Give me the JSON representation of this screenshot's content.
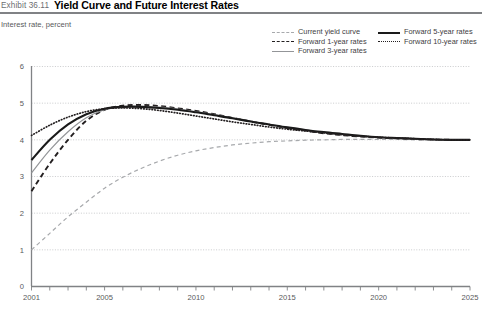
{
  "header": {
    "exhibit_number": "Exhibit 36.11",
    "title": "Yield Curve and Future Interest Rates"
  },
  "axis_caption": "Interest rate, percent",
  "legend": {
    "left_column": [
      {
        "label": "Current yield curve",
        "style": "dashed",
        "color": "#a7a9ac"
      },
      {
        "label": "Forward 1-year rates",
        "style": "dashed-bold",
        "color": "#231f20"
      },
      {
        "label": "Forward 3-year rates",
        "style": "solid",
        "color": "#939598"
      }
    ],
    "right_column": [
      {
        "label": "Forward 5-year rates",
        "style": "solid-bold",
        "color": "#1a1a1a"
      },
      {
        "label": "Forward 10-year rates",
        "style": "dotted",
        "color": "#231f20"
      }
    ]
  },
  "chart_data": {
    "type": "line",
    "title": "Yield Curve and Future Interest Rates",
    "xlabel": "",
    "ylabel": "Interest rate, percent",
    "xlim": [
      2001,
      2025
    ],
    "ylim": [
      0,
      6
    ],
    "yticks": [
      0,
      1,
      2,
      3,
      4,
      5,
      6
    ],
    "xticks": [
      2001,
      2005,
      2010,
      2015,
      2020,
      2025
    ],
    "xtick_labels": [
      "2001",
      "2005",
      "2010",
      "2015",
      "2020",
      "2025"
    ],
    "ytick_labels": [
      "0",
      "1",
      "2",
      "3",
      "4",
      "5",
      "6"
    ],
    "grid": "horizontal-dotted",
    "legend_position": "top-right",
    "x": [
      2001,
      2002,
      2003,
      2004,
      2005,
      2006,
      2007,
      2008,
      2009,
      2010,
      2011,
      2012,
      2013,
      2014,
      2015,
      2016,
      2017,
      2018,
      2019,
      2020,
      2021,
      2022,
      2023,
      2024,
      2025
    ],
    "series": [
      {
        "name": "Current yield curve",
        "style": "dashed",
        "color": "#a7a9ac",
        "values": [
          1.0,
          1.45,
          1.9,
          2.3,
          2.68,
          2.98,
          3.22,
          3.42,
          3.58,
          3.7,
          3.79,
          3.86,
          3.91,
          3.95,
          3.97,
          3.99,
          4.0,
          4.01,
          4.01,
          4.01,
          4.01,
          4.0,
          4.0,
          4.0,
          4.0
        ]
      },
      {
        "name": "Forward 1-year rates",
        "style": "dashed-bold",
        "color": "#231f20",
        "values": [
          2.6,
          3.35,
          4.0,
          4.52,
          4.82,
          4.93,
          4.95,
          4.92,
          4.86,
          4.79,
          4.7,
          4.6,
          4.5,
          4.41,
          4.32,
          4.25,
          4.18,
          4.13,
          4.09,
          4.06,
          4.04,
          4.02,
          4.01,
          4.0,
          4.0
        ]
      },
      {
        "name": "Forward 3-year rates",
        "style": "solid",
        "color": "#939598",
        "values": [
          3.1,
          3.72,
          4.22,
          4.6,
          4.82,
          4.9,
          4.91,
          4.89,
          4.84,
          4.77,
          4.69,
          4.6,
          4.51,
          4.42,
          4.34,
          4.27,
          4.2,
          4.15,
          4.1,
          4.07,
          4.04,
          4.02,
          4.01,
          4.0,
          4.0
        ]
      },
      {
        "name": "Forward 5-year rates",
        "style": "solid-bold",
        "color": "#1a1a1a",
        "values": [
          3.45,
          4.0,
          4.42,
          4.7,
          4.85,
          4.9,
          4.9,
          4.87,
          4.82,
          4.75,
          4.67,
          4.59,
          4.5,
          4.42,
          4.34,
          4.27,
          4.21,
          4.16,
          4.11,
          4.07,
          4.05,
          4.03,
          4.01,
          4.0,
          4.0
        ]
      },
      {
        "name": "Forward 10-year rates",
        "style": "dotted",
        "color": "#231f20",
        "values": [
          4.12,
          4.4,
          4.62,
          4.77,
          4.85,
          4.87,
          4.85,
          4.8,
          4.73,
          4.65,
          4.57,
          4.49,
          4.42,
          4.35,
          4.29,
          4.24,
          4.19,
          4.14,
          4.1,
          4.07,
          4.05,
          4.03,
          4.01,
          4.0,
          4.0
        ]
      }
    ]
  }
}
